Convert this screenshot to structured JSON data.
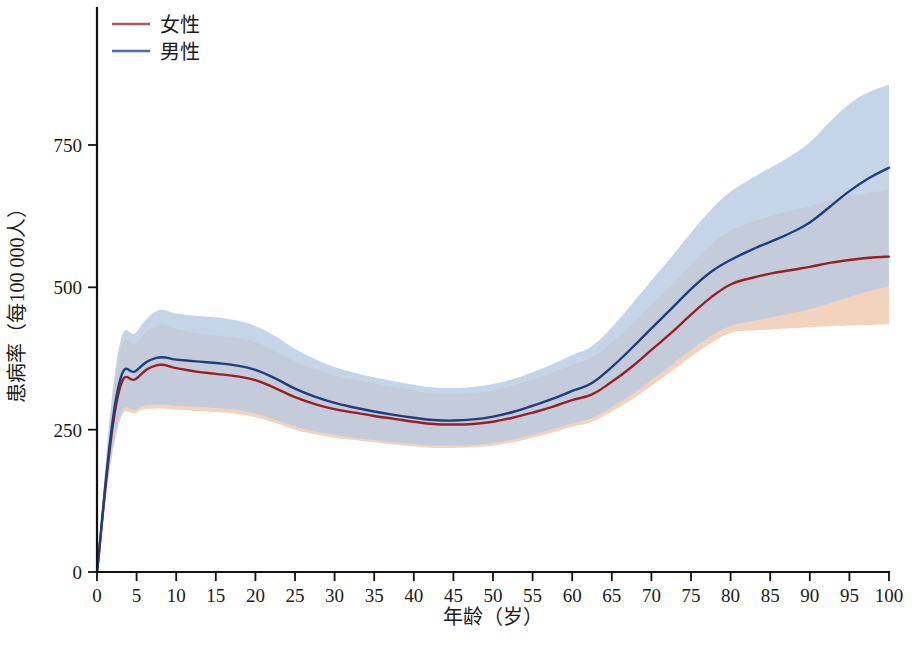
{
  "chart_data": {
    "type": "line",
    "title": "",
    "xlabel": "年龄（岁）",
    "ylabel": "患病率（每100 000人）",
    "xlim": [
      0,
      100
    ],
    "ylim": [
      0,
      900
    ],
    "grid": false,
    "legend_position": "top-left",
    "y_ticks": [
      0,
      250,
      500,
      750
    ],
    "y_tick_labels": [
      "0",
      "250",
      "500",
      "750"
    ],
    "x_ticks": [
      0,
      5,
      10,
      15,
      20,
      25,
      30,
      35,
      40,
      45,
      50,
      55,
      60,
      65,
      70,
      75,
      80,
      85,
      90,
      95,
      100
    ],
    "x_tick_labels": [
      "0",
      "5",
      "10",
      "15",
      "20",
      "25",
      "30",
      "35",
      "40",
      "45",
      "50",
      "55",
      "60",
      "65",
      "70",
      "75",
      "80",
      "85",
      "90",
      "95",
      "100"
    ],
    "x": [
      0,
      2.5,
      5,
      7.5,
      10,
      12.5,
      15,
      17.5,
      20,
      22.5,
      25,
      27.5,
      30,
      32.5,
      35,
      37.5,
      40,
      42.5,
      45,
      47.5,
      50,
      52.5,
      55,
      57.5,
      60,
      62.5,
      65,
      67.5,
      70,
      72.5,
      75,
      77.5,
      80,
      82.5,
      85,
      87.5,
      90,
      92.5,
      95,
      97.5,
      100
    ],
    "series": [
      {
        "name": "女性",
        "color": "#9b1f22",
        "band_color": "#eec9b0",
        "legend_color": "#b4575b",
        "values": [
          0,
          300,
          340,
          363,
          358,
          352,
          348,
          344,
          337,
          323,
          307,
          295,
          286,
          280,
          274,
          269,
          264,
          260,
          259,
          260,
          264,
          271,
          280,
          290,
          302,
          312,
          334,
          360,
          390,
          420,
          452,
          482,
          505,
          516,
          524,
          530,
          536,
          543,
          548,
          552,
          554
        ],
        "band_lower": [
          0,
          246,
          280,
          287,
          285,
          283,
          281,
          278,
          272,
          262,
          250,
          242,
          236,
          232,
          228,
          224,
          221,
          218,
          218,
          219,
          222,
          228,
          236,
          245,
          255,
          264,
          282,
          303,
          327,
          352,
          378,
          402,
          420,
          424,
          426,
          428,
          430,
          432,
          433,
          434,
          435
        ],
        "band_upper": [
          0,
          358,
          404,
          432,
          427,
          420,
          416,
          412,
          404,
          388,
          370,
          356,
          345,
          338,
          331,
          325,
          319,
          314,
          313,
          315,
          319,
          327,
          338,
          350,
          364,
          377,
          403,
          434,
          470,
          503,
          540,
          575,
          600,
          614,
          625,
          634,
          643,
          652,
          660,
          666,
          672
        ]
      },
      {
        "name": "男性",
        "color": "#1f3f7a",
        "band_color": "#b9cbe3",
        "legend_color": "#4a6ea5",
        "values": [
          0,
          312,
          354,
          376,
          373,
          370,
          367,
          363,
          355,
          340,
          322,
          308,
          297,
          289,
          282,
          276,
          271,
          267,
          266,
          268,
          273,
          281,
          292,
          304,
          318,
          332,
          360,
          393,
          428,
          462,
          497,
          527,
          548,
          565,
          580,
          595,
          614,
          641,
          669,
          692,
          710
        ],
        "band_lower": [
          0,
          252,
          286,
          294,
          292,
          290,
          288,
          285,
          279,
          268,
          256,
          247,
          241,
          236,
          232,
          228,
          225,
          222,
          222,
          223,
          227,
          233,
          241,
          251,
          261,
          271,
          290,
          312,
          337,
          363,
          390,
          414,
          432,
          440,
          447,
          454,
          462,
          472,
          483,
          493,
          502
        ],
        "band_upper": [
          0,
          372,
          422,
          458,
          454,
          450,
          447,
          442,
          432,
          414,
          392,
          374,
          360,
          350,
          342,
          335,
          329,
          324,
          323,
          325,
          330,
          339,
          351,
          365,
          381,
          397,
          430,
          470,
          512,
          553,
          596,
          636,
          668,
          690,
          710,
          730,
          755,
          790,
          822,
          843,
          856
        ]
      }
    ]
  },
  "legend": {
    "items": [
      {
        "label": "女性"
      },
      {
        "label": "男性"
      }
    ]
  },
  "axes": {
    "x_title": "年龄（岁）",
    "y_title": "患病率（每100 000人）"
  }
}
